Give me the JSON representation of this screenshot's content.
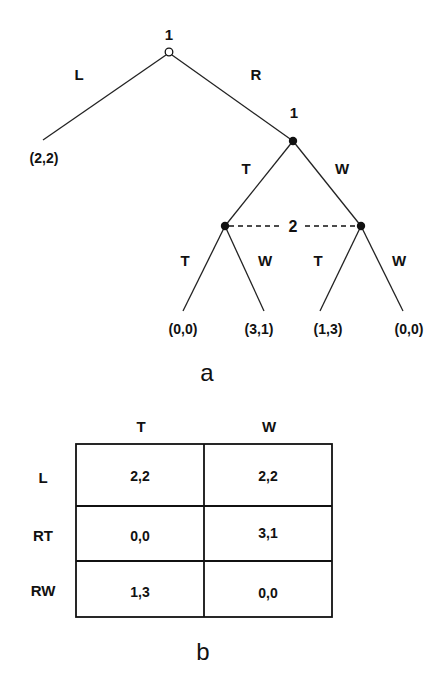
{
  "game_tree": {
    "caption": "a",
    "root": {
      "player_label": "1",
      "node_style": "open-circle",
      "actions": [
        {
          "label": "L",
          "payoff": "(2,2)"
        },
        {
          "label": "R"
        }
      ]
    },
    "node_r": {
      "player_label": "1",
      "node_style": "filled-circle",
      "actions": [
        {
          "label": "T"
        },
        {
          "label": "W"
        }
      ]
    },
    "information_set": {
      "player_label": "2",
      "style": "dashed",
      "nodes": [
        {
          "after": "T",
          "actions": [
            {
              "label": "T",
              "payoff": "(0,0)"
            },
            {
              "label": "W",
              "payoff": "(3,1)"
            }
          ]
        },
        {
          "after": "W",
          "actions": [
            {
              "label": "T",
              "payoff": "(1,3)"
            },
            {
              "label": "W",
              "payoff": "(0,0)"
            }
          ]
        }
      ]
    }
  },
  "payoff_matrix": {
    "caption": "b",
    "column_headers": [
      "T",
      "W"
    ],
    "rows": [
      {
        "label": "L",
        "cells": [
          "2,2",
          "2,2"
        ]
      },
      {
        "label": "RT",
        "cells": [
          "0,0",
          "3,1"
        ]
      },
      {
        "label": "RW",
        "cells": [
          "1,3",
          "0,0"
        ]
      }
    ]
  },
  "colors": {
    "ink": "#111111",
    "background": "#ffffff"
  }
}
